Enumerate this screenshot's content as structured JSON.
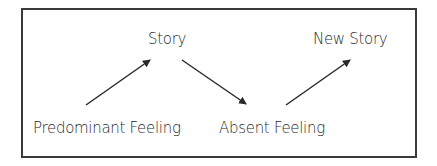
{
  "diagram": {
    "nodes": [
      {
        "id": "predominant-feeling",
        "label": "Predominant Feeling"
      },
      {
        "id": "story",
        "label": "Story"
      },
      {
        "id": "absent-feeling",
        "label": "Absent Feeling"
      },
      {
        "id": "new-story",
        "label": "New Story"
      }
    ],
    "edges": [
      {
        "from": "predominant-feeling",
        "to": "story"
      },
      {
        "from": "story",
        "to": "absent-feeling"
      },
      {
        "from": "absent-feeling",
        "to": "new-story"
      }
    ],
    "colors": {
      "line": "#2a2a2a",
      "border": "#3a3a3a",
      "background": "#ffffff"
    }
  }
}
